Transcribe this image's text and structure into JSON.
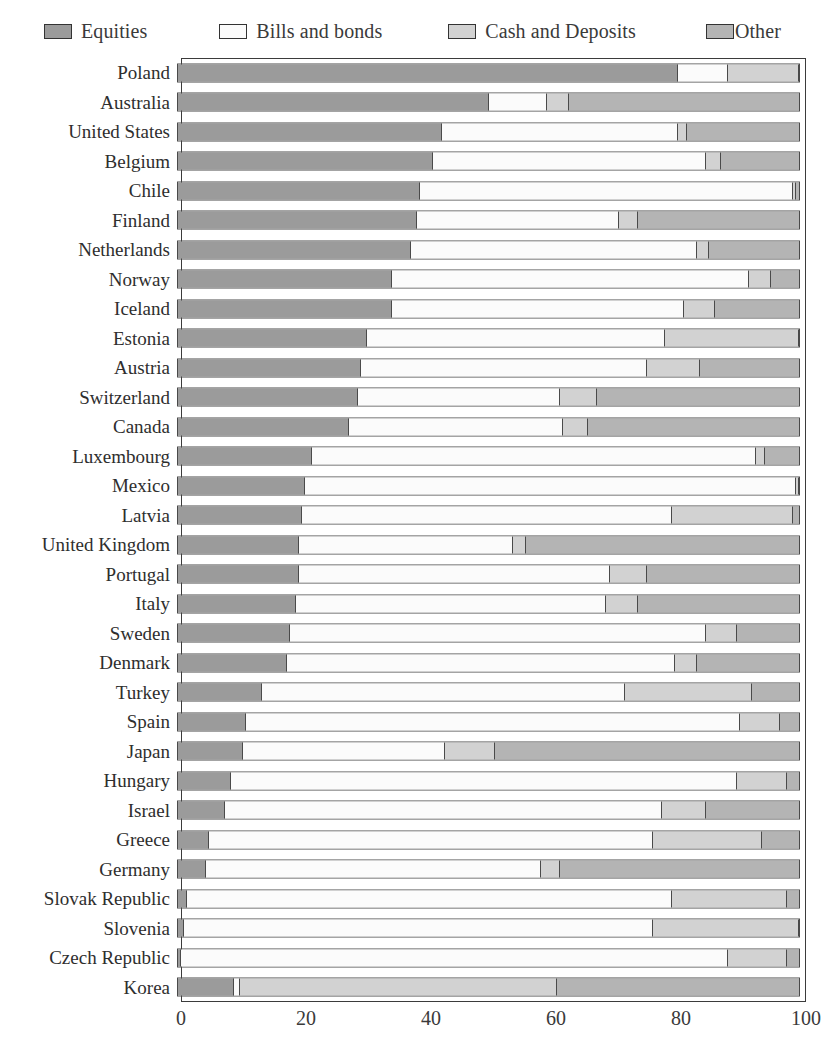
{
  "legend": {
    "items": [
      {
        "label": "Equities",
        "swatch": "equities-swatch",
        "color": "#9b9b9b"
      },
      {
        "label": "Bills and bonds",
        "swatch": "bills-swatch",
        "color": "#fbfbfb"
      },
      {
        "label": "Cash and Deposits",
        "swatch": "cash-swatch",
        "color": "#d2d2d2"
      },
      {
        "label": "Other",
        "swatch": "other-swatch",
        "color": "#b4b4b4"
      }
    ]
  },
  "axis": {
    "ticks": [
      "0",
      "20",
      "40",
      "60",
      "80",
      "100"
    ],
    "min": 0,
    "max": 100
  },
  "chart_data": {
    "type": "bar",
    "title": "",
    "xlabel": "",
    "ylabel": "",
    "orientation": "horizontal",
    "stacked": true,
    "stack_total": 100,
    "xlim": [
      0,
      100
    ],
    "grid": false,
    "legend_position": "top",
    "series": [
      {
        "name": "Equities",
        "color": "#9b9b9b"
      },
      {
        "name": "Bills and bonds",
        "color": "#fbfbfb"
      },
      {
        "name": "Cash and Deposits",
        "color": "#d2d2d2"
      },
      {
        "name": "Other",
        "color": "#b4b4b4"
      }
    ],
    "categories": [
      "Poland",
      "Australia",
      "United States",
      "Belgium",
      "Chile",
      "Finland",
      "Netherlands",
      "Norway",
      "Iceland",
      "Estonia",
      "Austria",
      "Switzerland",
      "Canada",
      "Luxembourg",
      "Mexico",
      "Latvia",
      "United Kingdom",
      "Portugal",
      "Italy",
      "Sweden",
      "Denmark",
      "Turkey",
      "Spain",
      "Japan",
      "Hungary",
      "Israel",
      "Greece",
      "Germany",
      "Slovak Republic",
      "Slovenia",
      "Czech Republic",
      "Korea"
    ],
    "rows": [
      {
        "category": "Poland",
        "values": [
          80.5,
          8.0,
          11.5,
          0.0
        ]
      },
      {
        "category": "Australia",
        "values": [
          50.0,
          9.5,
          3.5,
          37.0
        ]
      },
      {
        "category": "United States",
        "values": [
          42.5,
          38.0,
          1.5,
          18.0
        ]
      },
      {
        "category": "Belgium",
        "values": [
          41.0,
          44.0,
          2.5,
          12.5
        ]
      },
      {
        "category": "Chile",
        "values": [
          39.0,
          60.0,
          0.5,
          0.5
        ]
      },
      {
        "category": "Finland",
        "values": [
          38.5,
          32.5,
          3.0,
          26.0
        ]
      },
      {
        "category": "Netherlands",
        "values": [
          37.5,
          46.0,
          2.0,
          14.5
        ]
      },
      {
        "category": "Norway",
        "values": [
          34.5,
          57.5,
          3.5,
          4.5
        ]
      },
      {
        "category": "Iceland",
        "values": [
          34.5,
          47.0,
          5.0,
          13.5
        ]
      },
      {
        "category": "Estonia",
        "values": [
          30.5,
          48.0,
          21.5,
          0.0
        ]
      },
      {
        "category": "Austria",
        "values": [
          29.5,
          46.0,
          8.5,
          16.0
        ]
      },
      {
        "category": "Switzerland",
        "values": [
          29.0,
          32.5,
          6.0,
          32.5
        ]
      },
      {
        "category": "Canada",
        "values": [
          27.5,
          34.5,
          4.0,
          34.0
        ]
      },
      {
        "category": "Luxembourg",
        "values": [
          21.5,
          71.5,
          1.5,
          5.5
        ]
      },
      {
        "category": "Mexico",
        "values": [
          20.5,
          79.0,
          0.5,
          0.0
        ]
      },
      {
        "category": "Latvia",
        "values": [
          20.0,
          59.5,
          19.5,
          1.0
        ]
      },
      {
        "category": "United Kingdom",
        "values": [
          19.5,
          34.5,
          2.0,
          44.0
        ]
      },
      {
        "category": "Portugal",
        "values": [
          19.5,
          50.0,
          6.0,
          24.5
        ]
      },
      {
        "category": "Italy",
        "values": [
          19.0,
          50.0,
          5.0,
          26.0
        ]
      },
      {
        "category": "Sweden",
        "values": [
          18.0,
          67.0,
          5.0,
          10.0
        ]
      },
      {
        "category": "Denmark",
        "values": [
          17.5,
          62.5,
          3.5,
          16.5
        ]
      },
      {
        "category": "Turkey",
        "values": [
          13.5,
          58.5,
          20.5,
          7.5
        ]
      },
      {
        "category": "Spain",
        "values": [
          11.0,
          79.5,
          6.5,
          3.0
        ]
      },
      {
        "category": "Japan",
        "values": [
          10.5,
          32.5,
          8.0,
          49.0
        ]
      },
      {
        "category": "Hungary",
        "values": [
          8.5,
          81.5,
          8.0,
          2.0
        ]
      },
      {
        "category": "Israel",
        "values": [
          7.5,
          70.5,
          7.0,
          15.0
        ]
      },
      {
        "category": "Greece",
        "values": [
          5.0,
          71.5,
          17.5,
          6.0
        ]
      },
      {
        "category": "Germany",
        "values": [
          4.5,
          54.0,
          3.0,
          38.5
        ]
      },
      {
        "category": "Slovak Republic",
        "values": [
          1.5,
          78.0,
          18.5,
          2.0
        ]
      },
      {
        "category": "Slovenia",
        "values": [
          1.0,
          75.5,
          23.5,
          0.0
        ]
      },
      {
        "category": "Czech Republic",
        "values": [
          0.5,
          88.0,
          9.5,
          2.0
        ]
      },
      {
        "category": "Korea",
        "values": [
          9.0,
          1.0,
          51.0,
          39.0
        ]
      }
    ]
  }
}
